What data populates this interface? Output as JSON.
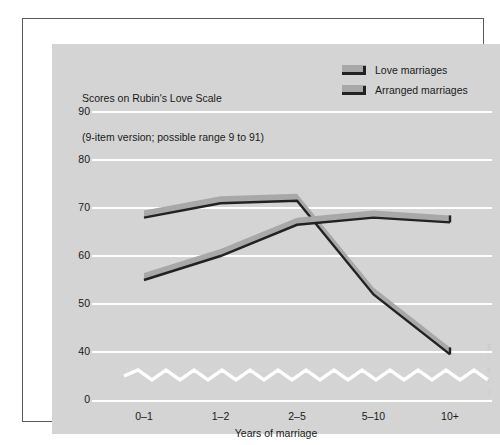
{
  "figure": {
    "side_caption": "F\ni\ne\nr\nc"
  },
  "chart_data": {
    "type": "line",
    "title": "Scores on Rubin's Love Scale",
    "subtitle": "(9-item version; possible range 9 to 91)",
    "xlabel": "Years of marriage",
    "ylabel": "",
    "categories": [
      "0–1",
      "1–2",
      "2–5",
      "5–10",
      "10+"
    ],
    "series": [
      {
        "name": "Love marriages",
        "values": [
          68,
          71,
          71.5,
          52,
          39.5
        ],
        "color": "#a8a8a8",
        "edge_color": "#222222"
      },
      {
        "name": "Arranged marriages",
        "values": [
          55,
          60,
          66.5,
          68,
          67
        ],
        "color": "#a8a8a8",
        "edge_color": "#222222"
      }
    ],
    "yticks": [
      90,
      80,
      70,
      60,
      50,
      40
    ],
    "ytick_below_break": 0,
    "ylim": [
      35,
      93
    ],
    "grid": true,
    "grid_color": "#ffffff",
    "axis_break": true,
    "legend_position": "top-right",
    "panel_color": "#d4d4d4"
  }
}
